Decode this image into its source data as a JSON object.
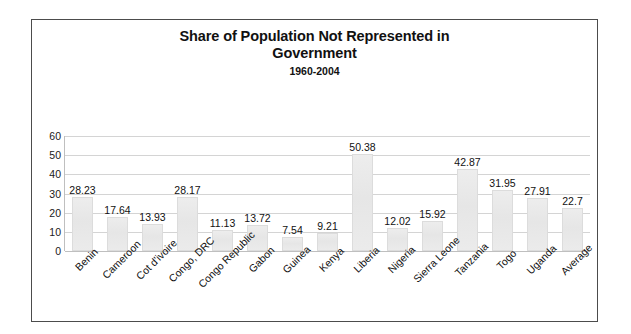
{
  "chart_data": {
    "type": "bar",
    "title": "Share of Population Not Represented in Government",
    "title_line1": "Share of Population Not Represented in",
    "title_line2": "Government",
    "subtitle": "1960-2004",
    "xlabel": "",
    "ylabel": "",
    "ylim": [
      0,
      60
    ],
    "ytick_step": 10,
    "yticks": [
      60,
      50,
      40,
      30,
      20,
      10,
      0
    ],
    "grid": true,
    "legend": false,
    "bar_color": "#e8e8e8",
    "bar_border_color": "#dcdcdc",
    "categories": [
      "Benin",
      "Cameroon",
      "Cot d'ivoire",
      "Congo, DRC",
      "Congo Republic",
      "Gabon",
      "Guinea",
      "Kenya",
      "Liberia",
      "Nigeria",
      "Sierra Leone",
      "Tanzania",
      "Togo",
      "Uganda",
      "Average"
    ],
    "values": [
      28.23,
      17.64,
      13.93,
      28.17,
      11.13,
      13.72,
      7.54,
      9.21,
      50.38,
      12.02,
      15.92,
      42.87,
      31.95,
      27.91,
      22.7
    ],
    "value_labels": [
      "28.23",
      "17.64",
      "13.93",
      "28.17",
      "11.13",
      "13.72",
      "7.54",
      "9.21",
      "50.38",
      "12.02",
      "15.92",
      "42.87",
      "31.95",
      "27.91",
      "22.7"
    ]
  }
}
